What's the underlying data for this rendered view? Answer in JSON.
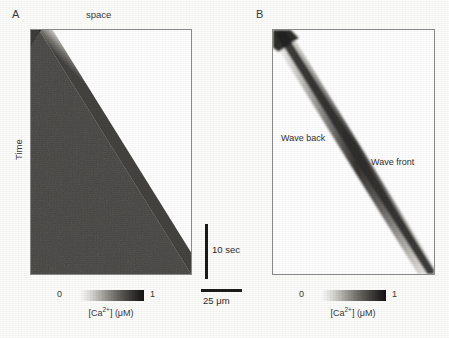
{
  "figure": {
    "width": 449,
    "height": 338,
    "background": "#fdfdfc"
  },
  "panels": [
    {
      "letter": "A",
      "type": "kymograph",
      "x_axis_title": "space",
      "y_axis_title": "Time",
      "box": {
        "left": 30,
        "top": 29,
        "width": 162,
        "height": 246
      },
      "letter_pos": {
        "left": 12,
        "top": 8
      },
      "x_title_pos": {
        "left": 86,
        "top": 9
      },
      "y_title_pos": {
        "left": 13,
        "top": 160
      },
      "colorbar": {
        "min_label": "0",
        "max_label": "1",
        "caption_prefix": "[Ca",
        "caption_charge": "2+",
        "caption_suffix": "] (μM)",
        "gradient_from": "#ffffff",
        "gradient_to": "#151413",
        "bar": {
          "left": 78,
          "top": 290,
          "width": 66,
          "height": 11
        },
        "min_pos": {
          "left": 57,
          "top": 289
        },
        "max_pos": {
          "left": 150,
          "top": 289
        },
        "caption_pos": {
          "left": 51,
          "top": 308,
          "width": 120
        }
      }
    },
    {
      "letter": "B",
      "type": "wave-band",
      "box": {
        "left": 272,
        "top": 29,
        "width": 163,
        "height": 246
      },
      "letter_pos": {
        "left": 256,
        "top": 8
      },
      "labels": [
        {
          "text": "Wave back",
          "left": 280,
          "top": 132
        },
        {
          "text": "Wave front",
          "left": 370,
          "top": 156
        }
      ],
      "colorbar": {
        "min_label": "0",
        "max_label": "1",
        "caption_prefix": "[Ca",
        "caption_charge": "2+",
        "caption_suffix": "] (μM)",
        "gradient_from": "#ffffff",
        "gradient_to": "#151413",
        "bar": {
          "left": 320,
          "top": 290,
          "width": 66,
          "height": 11
        },
        "min_pos": {
          "left": 299,
          "top": 289
        },
        "max_pos": {
          "left": 392,
          "top": 289
        },
        "caption_pos": {
          "left": 293,
          "top": 308,
          "width": 120
        }
      }
    }
  ],
  "scalebars": {
    "time": {
      "label": "10 sec",
      "orientation": "vertical",
      "bar": {
        "left": 205,
        "top": 224,
        "width": 3,
        "height": 55
      },
      "label_pos": {
        "left": 212,
        "top": 244
      }
    },
    "space": {
      "label": "25 μm",
      "orientation": "horizontal",
      "bar": {
        "left": 201,
        "top": 289,
        "width": 41,
        "height": 3
      },
      "label_pos": {
        "left": 203,
        "top": 295
      }
    }
  },
  "chart_data": {
    "type": "heatmap",
    "title": "",
    "subtitle": "",
    "panels": [
      {
        "id": "A",
        "description": "Kymograph of a saltatory/continuous calcium wave: dark (high [Ca2+]) region occupies the lower-left triangle; the wave front advances in space as time increases.",
        "xlabel": "space",
        "ylabel": "Time",
        "colormap": "grayscale-inverted",
        "value_label": "[Ca2+] (uM)",
        "zlim": [
          0,
          1
        ],
        "zticks": [
          0,
          1
        ],
        "grid": false,
        "region_high_value": 1.0,
        "region_low_value": 0.0,
        "front_line": {
          "x0_frac": 0.05,
          "y0_frac": 0.0,
          "x1_frac": 1.0,
          "y1_frac": 1.0
        }
      },
      {
        "id": "B",
        "description": "Kymograph of a solitary propagating calcium wave: only a narrow diagonal band is elevated; 'Wave back' marks the trailing (upper-left) edge and 'Wave front' the leading (lower-right) edge.",
        "xlabel": "space",
        "ylabel": "Time",
        "colormap": "grayscale-inverted",
        "value_label": "[Ca2+] (uM)",
        "zlim": [
          0,
          1
        ],
        "zticks": [
          0,
          1
        ],
        "grid": false,
        "band_width_frac": 0.07,
        "band_peak_value": 1.0,
        "baseline_value": 0.0,
        "front_line": {
          "x0_frac": 0.03,
          "y0_frac": 0.0,
          "x1_frac": 1.0,
          "y1_frac": 1.0
        },
        "annotations": [
          "Wave back",
          "Wave front"
        ]
      }
    ],
    "scalebars": [
      {
        "axis": "time",
        "length_label": "10 sec"
      },
      {
        "axis": "space",
        "length_label": "25 μm"
      }
    ]
  }
}
